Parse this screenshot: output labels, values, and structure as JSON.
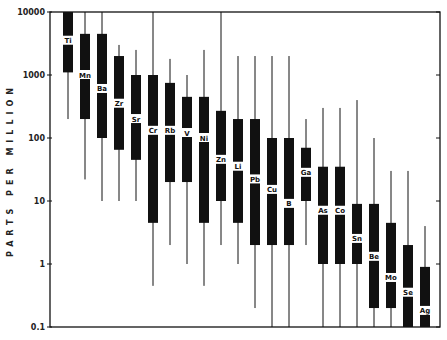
{
  "chart_data": {
    "type": "box",
    "title": "",
    "xlabel": "",
    "ylabel": "PARTS PER MILLION",
    "yscale": "log",
    "ylim": [
      0.1,
      10000
    ],
    "yticks": [
      {
        "value": 10000,
        "label": "10000"
      },
      {
        "value": 1000,
        "label": "1000"
      },
      {
        "value": 100,
        "label": "100"
      },
      {
        "value": 10,
        "label": "10"
      },
      {
        "value": 1,
        "label": "1"
      },
      {
        "value": 0.1,
        "label": "0.1"
      }
    ],
    "grid": false,
    "legend": null,
    "categories": [
      "Ti",
      "Mn",
      "Ba",
      "Zr",
      "Sr",
      "Cr",
      "Rb",
      "V",
      "Ni",
      "Zn",
      "Li",
      "Pb",
      "Cu",
      "B",
      "Ga",
      "As",
      "Co",
      "Sn",
      "Be",
      "Mo",
      "Se",
      "Ag"
    ],
    "series": [
      {
        "element": "Ti",
        "label": "Ti",
        "whisker_max": 10000,
        "box_max": 10000,
        "box_min": 1100,
        "whisker_min": 200,
        "label_value": 3500
      },
      {
        "element": "Mn",
        "label": "Mn",
        "whisker_max": 10000,
        "box_max": 4500,
        "box_min": 200,
        "whisker_min": 22,
        "label_value": 1000
      },
      {
        "element": "Ba",
        "label": "Ba",
        "whisker_max": 10000,
        "box_max": 4500,
        "box_min": 100,
        "whisker_min": 10,
        "label_value": 600
      },
      {
        "element": "Zr",
        "label": "Zr",
        "whisker_max": 3000,
        "box_max": 2000,
        "box_min": 65,
        "whisker_min": 10,
        "label_value": 350
      },
      {
        "element": "Sr",
        "label": "Sr",
        "whisker_max": 2500,
        "box_max": 1000,
        "box_min": 45,
        "whisker_min": 10,
        "label_value": 200
      },
      {
        "element": "Cr",
        "label": "Cr",
        "whisker_max": 10000,
        "box_max": 1000,
        "box_min": 4.5,
        "whisker_min": 0.45,
        "label_value": 130
      },
      {
        "element": "Rb",
        "label": "Rb",
        "whisker_max": 1800,
        "box_max": 750,
        "box_min": 20,
        "whisker_min": 2,
        "label_value": 130
      },
      {
        "element": "V",
        "label": "V",
        "whisker_max": 1000,
        "box_max": 450,
        "box_min": 20,
        "whisker_min": 1,
        "label_value": 120
      },
      {
        "element": "Ni",
        "label": "Ni",
        "whisker_max": 2500,
        "box_max": 450,
        "box_min": 4.5,
        "whisker_min": 0.45,
        "label_value": 100
      },
      {
        "element": "Zn",
        "label": "Zn",
        "whisker_max": 10000,
        "box_max": 270,
        "box_min": 10,
        "whisker_min": 2,
        "label_value": 45
      },
      {
        "element": "Li",
        "label": "Li",
        "whisker_max": 2000,
        "box_max": 200,
        "box_min": 4.5,
        "whisker_min": 1,
        "label_value": 35
      },
      {
        "element": "Pb",
        "label": "Pb",
        "whisker_max": 2000,
        "box_max": 200,
        "box_min": 2,
        "whisker_min": 0.2,
        "label_value": 22
      },
      {
        "element": "Cu",
        "label": "Cu",
        "whisker_max": 2000,
        "box_max": 100,
        "box_min": 2,
        "whisker_min": 0.1,
        "label_value": 15
      },
      {
        "element": "B",
        "label": "B",
        "whisker_max": 2000,
        "box_max": 100,
        "box_min": 2,
        "whisker_min": 0.1,
        "label_value": 9
      },
      {
        "element": "Ga",
        "label": "Ga",
        "whisker_max": 200,
        "box_max": 70,
        "box_min": 10,
        "whisker_min": 2,
        "label_value": 28
      },
      {
        "element": "As",
        "label": "As",
        "whisker_max": 300,
        "box_max": 35,
        "box_min": 1,
        "whisker_min": 0.1,
        "label_value": 7
      },
      {
        "element": "Co",
        "label": "Co",
        "whisker_max": 300,
        "box_max": 35,
        "box_min": 1,
        "whisker_min": 0.1,
        "label_value": 7
      },
      {
        "element": "Sn",
        "label": "Sn",
        "whisker_max": 400,
        "box_max": 9,
        "box_min": 1,
        "whisker_min": 0.1,
        "label_value": 2.5
      },
      {
        "element": "Be",
        "label": "Be",
        "whisker_max": 100,
        "box_max": 9,
        "box_min": 0.2,
        "whisker_min": 0.1,
        "label_value": 1.3
      },
      {
        "element": "Mo",
        "label": "Mo",
        "whisker_max": 30,
        "box_max": 4.5,
        "box_min": 0.2,
        "whisker_min": 0.1,
        "label_value": 0.6
      },
      {
        "element": "Se",
        "label": "Se",
        "whisker_max": 30,
        "box_max": 2,
        "box_min": 0.1,
        "whisker_min": 0.1,
        "label_value": 0.35
      },
      {
        "element": "Ag",
        "label": "Ag",
        "whisker_max": 4,
        "box_max": 0.9,
        "box_min": 0.1,
        "whisker_min": 0.1,
        "label_value": 0.18
      }
    ]
  },
  "axis": {
    "ylabel_letters": "PARTS PER MILLION"
  },
  "colors": {
    "ink": "#111111",
    "background": "#ffffff"
  }
}
